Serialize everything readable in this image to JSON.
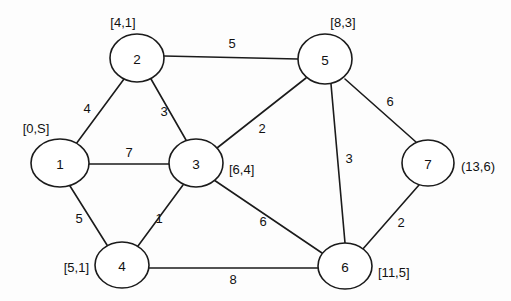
{
  "diagram": {
    "kind": "weighted-undirected-graph",
    "background_color": "#fdfdfd",
    "line_color": "#1b1b1b",
    "node_fill_color": "#ffffff",
    "text_color": "#111111",
    "width": 511,
    "height": 301
  },
  "nodes": [
    {
      "id": "1",
      "label": "1",
      "cx": 60,
      "cy": 163,
      "rx": 29,
      "ry": 24,
      "annotation": "[0,S]",
      "anno_x": 36,
      "anno_y": 128,
      "anno_anchor": "anno-middle"
    },
    {
      "id": "2",
      "label": "2",
      "cx": 137,
      "cy": 58,
      "rx": 27,
      "ry": 24,
      "annotation": "[4,1]",
      "anno_x": 123,
      "anno_y": 22,
      "anno_anchor": "anno-middle"
    },
    {
      "id": "3",
      "label": "3",
      "cx": 196,
      "cy": 163,
      "rx": 27,
      "ry": 24,
      "annotation": "[6,4]",
      "anno_x": 229,
      "anno_y": 169,
      "anno_anchor": "anno-start"
    },
    {
      "id": "4",
      "label": "4",
      "cx": 122,
      "cy": 265,
      "rx": 27,
      "ry": 23,
      "annotation": "[5,1]",
      "anno_x": 89,
      "anno_y": 267,
      "anno_anchor": "anno-end"
    },
    {
      "id": "5",
      "label": "5",
      "cx": 325,
      "cy": 59,
      "rx": 27,
      "ry": 25,
      "annotation": "[8,3]",
      "anno_x": 343,
      "anno_y": 22,
      "anno_anchor": "anno-middle"
    },
    {
      "id": "6",
      "label": "6",
      "cx": 345,
      "cy": 266,
      "rx": 27,
      "ry": 23,
      "annotation": "[11,5]",
      "anno_x": 378,
      "anno_y": 272,
      "anno_anchor": "anno-start"
    },
    {
      "id": "7",
      "label": "7",
      "cx": 428,
      "cy": 163,
      "rx": 26,
      "ry": 23,
      "annotation": "(13,6)",
      "anno_x": 461,
      "anno_y": 166,
      "anno_anchor": "anno-start"
    }
  ],
  "edges": [
    {
      "name": "edge-1-2",
      "from": "1",
      "to": "2",
      "weight": "4",
      "x1": 76,
      "y1": 144,
      "x2": 124,
      "y2": 79,
      "wx": 87,
      "wy": 108
    },
    {
      "name": "edge-1-3",
      "from": "1",
      "to": "3",
      "weight": "7",
      "x1": 89,
      "y1": 164,
      "x2": 169,
      "y2": 164,
      "wx": 129,
      "wy": 152
    },
    {
      "name": "edge-1-4",
      "from": "1",
      "to": "4",
      "weight": "5",
      "x1": 70,
      "y1": 186,
      "x2": 107,
      "y2": 245,
      "wx": 79,
      "wy": 218
    },
    {
      "name": "edge-2-3",
      "from": "2",
      "to": "3",
      "weight": "3",
      "x1": 151,
      "y1": 79,
      "x2": 186,
      "y2": 140,
      "wx": 164,
      "wy": 111
    },
    {
      "name": "edge-2-5",
      "from": "2",
      "to": "5",
      "weight": "5",
      "x1": 164,
      "y1": 56,
      "x2": 298,
      "y2": 59,
      "wx": 232,
      "wy": 43
    },
    {
      "name": "edge-3-4",
      "from": "3",
      "to": "4",
      "weight": "1",
      "x1": 183,
      "y1": 185,
      "x2": 138,
      "y2": 246,
      "wx": 159,
      "wy": 218
    },
    {
      "name": "edge-3-5",
      "from": "3",
      "to": "5",
      "weight": "2",
      "x1": 217,
      "y1": 148,
      "x2": 306,
      "y2": 78,
      "wx": 262,
      "wy": 128
    },
    {
      "name": "edge-3-6",
      "from": "3",
      "to": "6",
      "weight": "6",
      "x1": 214,
      "y1": 180,
      "x2": 322,
      "y2": 253,
      "wx": 263,
      "wy": 221
    },
    {
      "name": "edge-4-6",
      "from": "4",
      "to": "6",
      "weight": "8",
      "x1": 149,
      "y1": 268,
      "x2": 318,
      "y2": 268,
      "wx": 233,
      "wy": 279
    },
    {
      "name": "edge-5-6",
      "from": "5",
      "to": "6",
      "weight": "3",
      "x1": 331,
      "y1": 84,
      "x2": 345,
      "y2": 243,
      "wx": 349,
      "wy": 158
    },
    {
      "name": "edge-5-7",
      "from": "5",
      "to": "7",
      "weight": "6",
      "x1": 345,
      "y1": 79,
      "x2": 416,
      "y2": 142,
      "wx": 390,
      "wy": 101
    },
    {
      "name": "edge-6-7",
      "from": "6",
      "to": "7",
      "weight": "2",
      "x1": 362,
      "y1": 250,
      "x2": 419,
      "y2": 185,
      "wx": 401,
      "wy": 222
    }
  ]
}
